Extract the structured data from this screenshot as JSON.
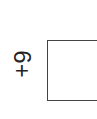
{
  "problem": {
    "label": "6+",
    "orientation": "rotated-90",
    "answer_value": ""
  },
  "colors": {
    "text": "#222222",
    "box_border": "#444444",
    "background": "#ffffff"
  }
}
